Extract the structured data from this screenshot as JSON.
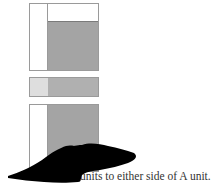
{
  "diagram": {
    "panels": [
      {
        "name": "top-square",
        "left_column": "white",
        "top_row": "white",
        "main": "gray"
      },
      {
        "name": "middle-strip",
        "left_segment": "light-gray",
        "main": "gray"
      },
      {
        "name": "bottom-square",
        "left_column": "white",
        "main": "gray"
      }
    ],
    "colors": {
      "gray": "#a4a4a4",
      "light_gray": "#dedede",
      "border": "#9a9a9a",
      "redaction": "#000000"
    }
  },
  "caption": {
    "visible_text": "units to either side of A unit."
  }
}
